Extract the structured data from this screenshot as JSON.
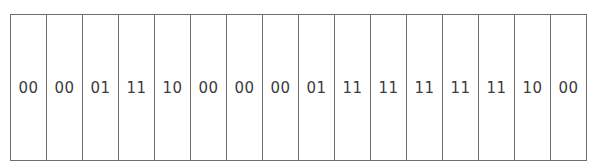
{
  "diagram": {
    "type": "bit-pair strip",
    "cells": [
      {
        "value": "00"
      },
      {
        "value": "00"
      },
      {
        "value": "01"
      },
      {
        "value": "11"
      },
      {
        "value": "10"
      },
      {
        "value": "00"
      },
      {
        "value": "00"
      },
      {
        "value": "00"
      },
      {
        "value": "01"
      },
      {
        "value": "11"
      },
      {
        "value": "11"
      },
      {
        "value": "11"
      },
      {
        "value": "11"
      },
      {
        "value": "11"
      },
      {
        "value": "10"
      },
      {
        "value": "00"
      }
    ],
    "colors": {
      "border": "#6e6e6e",
      "text": "#3c3c3c",
      "background": "#ffffff"
    }
  }
}
